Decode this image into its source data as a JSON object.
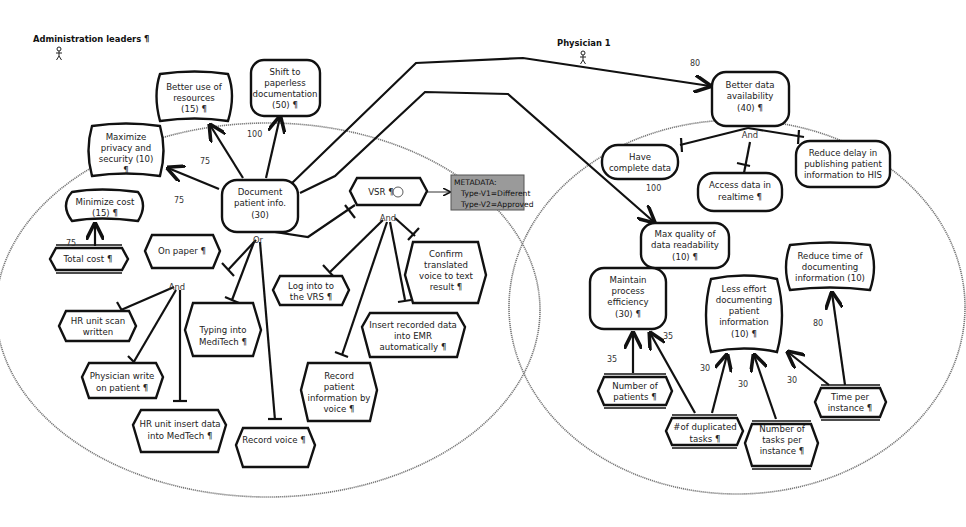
{
  "actors": {
    "left": {
      "label": "Administration leaders ¶"
    },
    "right": {
      "label": "Physician 1"
    }
  },
  "left_goals": {
    "better_use": [
      "Better use of",
      "resources",
      "(15) ¶"
    ],
    "shift_paperless": [
      "Shift to",
      "paperless",
      "documentation",
      "(50) ¶"
    ],
    "maximize_privacy": [
      "Maximize",
      "privacy and",
      "security  (10)",
      "¶"
    ],
    "minimize_cost": [
      "Minimize cost",
      "(15) ¶"
    ],
    "document_patient": [
      "Document",
      "patient info.",
      "(30)"
    ]
  },
  "left_tasks": {
    "total_cost": [
      "Total cost ¶"
    ],
    "on_paper": [
      "On paper ¶"
    ],
    "vsr": [
      "VSR ¶"
    ],
    "hr_scan": [
      "HR unit scan",
      "written"
    ],
    "physician_write": [
      "Physician write",
      "on patient ¶"
    ],
    "hr_insert": [
      "HR unit insert data",
      "into MedTech ¶"
    ],
    "typing_meditech": [
      "Typing into",
      "MediTech ¶"
    ],
    "record_voice": [
      "Record voice ¶"
    ],
    "log_vrs": [
      "Log into to",
      "the VRS ¶"
    ],
    "confirm_translated": [
      "Confirm",
      "translated",
      "voice to text",
      "result ¶"
    ],
    "insert_recorded": [
      "Insert recorded data",
      "into EMR",
      "automatically ¶"
    ],
    "record_patient_voice": [
      "Record",
      "patient",
      "information by",
      "voice ¶"
    ]
  },
  "metadata_box": {
    "lines": [
      "METADATA:",
      "Type-V1=Different",
      "Type-V2=Approved"
    ]
  },
  "right_goals": {
    "better_data": [
      "Better data",
      "availability",
      "(40) ¶"
    ],
    "have_complete": [
      "Have",
      "complete data"
    ],
    "access_realtime": [
      "Access data in",
      "realtime ¶"
    ],
    "reduce_delay": [
      "Reduce delay in",
      "publishing patient",
      "information to HIS"
    ],
    "max_quality": [
      "Max quality of",
      "data readability",
      "(10) ¶"
    ],
    "maintain_process": [
      "Maintain",
      "process",
      "efficiency",
      "(30) ¶"
    ],
    "less_effort": [
      "Less effort",
      "documenting",
      "patient",
      "information",
      "(10) ¶"
    ],
    "reduce_time": [
      "Reduce time of",
      "documenting",
      "information  (10)"
    ]
  },
  "right_indicators": {
    "number_patients": [
      "Number of",
      "patients ¶"
    ],
    "duplicated_tasks": [
      "#of duplicated",
      "tasks ¶"
    ],
    "tasks_per_instance": [
      "Number of",
      "tasks per",
      "instance ¶"
    ],
    "time_per_instance": [
      "Time per",
      "instance ¶"
    ]
  },
  "decompositions": {
    "or": "Or",
    "and1": "And",
    "and2": "And",
    "and3": "And"
  },
  "weights": {
    "w_privacy": "75",
    "w_better_use": "75",
    "w_shift": "100",
    "w_cost": "75",
    "w_better_data": "80",
    "w_complete": "100",
    "w_np": "35",
    "w_dup_maintain": "35",
    "w_dup_less": "30",
    "w_tpi": "30",
    "w_time_less": "30",
    "w_time_reduce": "80"
  }
}
